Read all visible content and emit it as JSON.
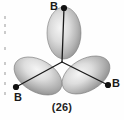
{
  "figure": {
    "caption": "(26)",
    "background_color": "#fefefe",
    "line_color": "#1a1a1a",
    "geometry": "trigonal planar",
    "center": {
      "x": 62,
      "y": 62
    },
    "atoms": [
      {
        "id": "b-top",
        "label": "B",
        "x": 64,
        "y": 8,
        "label_x": 50,
        "label_y": 1
      },
      {
        "id": "b-left",
        "label": "B",
        "x": 16,
        "y": 87,
        "label_x": 14,
        "label_y": 92
      },
      {
        "id": "b-right",
        "label": "B",
        "x": 108,
        "y": 85,
        "label_x": 112,
        "label_y": 78
      }
    ],
    "lobes": [
      {
        "id": "lobe-top",
        "cx": 64,
        "cy": 33,
        "rx": 17,
        "ry": 26,
        "rotation": 0,
        "fill": "lobe-shade-vertical"
      },
      {
        "id": "lobe-left",
        "cx": 38,
        "cy": 76,
        "rx": 26,
        "ry": 16,
        "rotation": 30,
        "fill": "lobe-shade-left"
      },
      {
        "id": "lobe-right",
        "cx": 86,
        "cy": 75,
        "rx": 26,
        "ry": 16,
        "rotation": -30,
        "fill": "lobe-shade-right"
      }
    ],
    "bonds": [
      {
        "id": "bond-top",
        "x1": 62,
        "y1": 62,
        "x2": 64,
        "y2": 8
      },
      {
        "id": "bond-left",
        "x1": 62,
        "y1": 62,
        "x2": 16,
        "y2": 87
      },
      {
        "id": "bond-right",
        "x1": 62,
        "y1": 62,
        "x2": 108,
        "y2": 85
      }
    ],
    "colors": {
      "lobe_light": "#f2f2f2",
      "lobe_mid": "#c8c8c8",
      "lobe_dark": "#8f8f8f",
      "lobe_edge": "#6e6e6e",
      "bond": "#1a1a1a",
      "vertex": "#111111",
      "text": "#1a1a1a"
    },
    "scan_artifacts": [
      {
        "x": 4,
        "y": 16
      },
      {
        "x": 4,
        "y": 24
      },
      {
        "x": 4,
        "y": 31
      },
      {
        "x": 4,
        "y": 47
      },
      {
        "x": 4,
        "y": 62
      },
      {
        "x": 4,
        "y": 72
      },
      {
        "x": 4,
        "y": 82
      },
      {
        "x": 4,
        "y": 92
      }
    ]
  }
}
